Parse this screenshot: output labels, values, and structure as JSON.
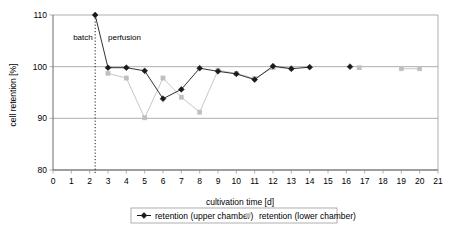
{
  "chart_data": {
    "type": "line",
    "title": "",
    "xlabel": "cultivation  time [d]",
    "ylabel": "cell retention [%]",
    "xlim": [
      0,
      21
    ],
    "ylim": [
      80,
      110
    ],
    "xticks": [
      "0",
      "1",
      "2",
      "3",
      "4",
      "5",
      "6",
      "7",
      "8",
      "9",
      "10",
      "11",
      "12",
      "13",
      "14",
      "15",
      "16",
      "17",
      "18",
      "19",
      "20",
      "21"
    ],
    "yticks": [
      "80",
      "90",
      "100",
      "110"
    ],
    "grid": "horizontal",
    "legend_position": "bottom",
    "annotations": [
      {
        "text": "batch",
        "x": 1.1,
        "y": 105.2
      },
      {
        "text": "perfusion",
        "x": 3.0,
        "y": 105.2
      }
    ],
    "vline": {
      "x": 2.3,
      "style": "dotted",
      "marker_y": 110
    },
    "series": [
      {
        "name": "retention (upper chamber)",
        "color": "#1a1a1a",
        "marker": "diamond",
        "points": [
          {
            "x": 2.3,
            "y": 110.0
          },
          {
            "x": 3.0,
            "y": 99.8
          },
          {
            "x": 4.0,
            "y": 99.8
          },
          {
            "x": 5.0,
            "y": 99.2
          },
          {
            "x": 6.0,
            "y": 93.8
          },
          {
            "x": 7.0,
            "y": 95.6
          },
          {
            "x": 8.0,
            "y": 99.7
          },
          {
            "x": 9.0,
            "y": 99.1
          },
          {
            "x": 10.0,
            "y": 98.6
          },
          {
            "x": 11.0,
            "y": 97.5
          },
          {
            "x": 12.0,
            "y": 100.1
          },
          {
            "x": 13.0,
            "y": 99.6
          },
          {
            "x": 14.0,
            "y": 99.9
          },
          {
            "x": 16.2,
            "y": 100.0
          }
        ]
      },
      {
        "name": "retention (lower chamber)",
        "color": "#bfbfbf",
        "marker": "square",
        "points": [
          {
            "x": 3.0,
            "y": 98.7
          },
          {
            "x": 4.0,
            "y": 97.8
          },
          {
            "x": 5.0,
            "y": 90.1
          },
          {
            "x": 6.0,
            "y": 97.8
          },
          {
            "x": 7.0,
            "y": 94.1
          },
          {
            "x": 8.0,
            "y": 91.2
          },
          {
            "x": 9.0,
            "y": 99.3
          },
          {
            "x": 10.0,
            "y": 98.7
          },
          {
            "x": 11.0,
            "y": 97.7
          },
          {
            "x": 12.0,
            "y": 99.8
          },
          {
            "x": 13.0,
            "y": 99.7
          },
          {
            "x": 16.7,
            "y": 99.8
          },
          {
            "x": 19.0,
            "y": 99.6
          },
          {
            "x": 20.0,
            "y": 99.6
          }
        ]
      }
    ]
  },
  "legend": {
    "items": [
      {
        "label": "retention (upper chamber)",
        "color": "#1a1a1a",
        "marker": "diamond"
      },
      {
        "label": "retention (lower chamber)",
        "color": "#bfbfbf",
        "marker": "square"
      }
    ]
  }
}
